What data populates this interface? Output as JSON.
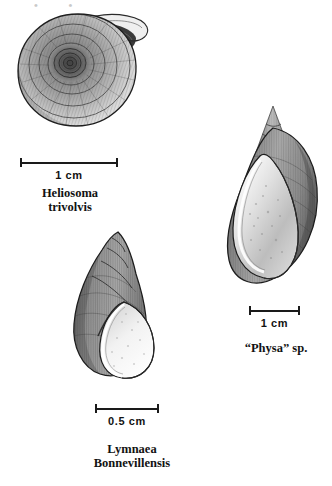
{
  "plate": {
    "background_color": "#ffffff",
    "ink_color": "#1a1a1a",
    "style": "black-and-white stipple-and-line scientific illustration",
    "top_cropped_text": "• •"
  },
  "figures": [
    {
      "id": "heliosoma",
      "common_form": "planorbid flat-coiled shell, aperture at upper right",
      "scale_label": "1 cm",
      "caption_lines": [
        "Heliosoma",
        "trivolvis"
      ]
    },
    {
      "id": "physa",
      "common_form": "sinistral high-spired shell with very large aperture",
      "scale_label": "1 cm",
      "caption_lines": [
        "“Physa” sp."
      ]
    },
    {
      "id": "lymnaea",
      "common_form": "dextral conical shell with broad body whorl",
      "scale_label": "0.5 cm",
      "caption_lines": [
        "Lymnaea",
        "Bonnevillensis"
      ]
    }
  ]
}
